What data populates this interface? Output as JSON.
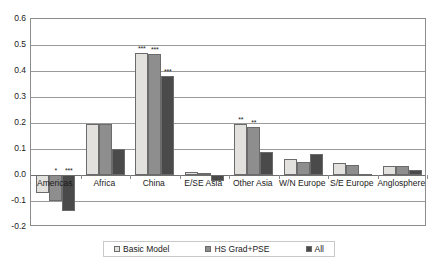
{
  "chart_data": {
    "type": "bar",
    "title": "",
    "subtitle": "",
    "xlabel": "",
    "ylabel": "",
    "ylim": [
      -0.2,
      0.6
    ],
    "ytick_labels": [
      "0.6",
      "0.5",
      "0.4",
      "0.3",
      "0.2",
      "0.1",
      "0.0",
      "-0.1",
      "-0.2"
    ],
    "ytick_values": [
      0.6,
      0.5,
      0.4,
      0.3,
      0.2,
      0.1,
      0.0,
      -0.1,
      -0.2
    ],
    "grid": true,
    "grid_axis": "y",
    "legend_position": "bottom",
    "categories": [
      "Americas",
      "Africa",
      "China",
      "E/SE Asia",
      "Other Asia",
      "W/N Europe",
      "S/E Europe",
      "Anglosphere"
    ],
    "series": [
      {
        "name": "Basic Model",
        "color": "#e2e1dd",
        "values": [
          -0.07,
          0.195,
          0.47,
          0.012,
          0.195,
          0.06,
          0.045,
          0.035
        ],
        "significance": [
          "",
          "",
          "***",
          "",
          "**",
          "",
          "",
          ""
        ]
      },
      {
        "name": "HS Grad+PSE",
        "color": "#8e8e8e",
        "values": [
          -0.1,
          0.195,
          0.465,
          0.006,
          0.185,
          0.05,
          0.04,
          0.035
        ],
        "significance": [
          "*",
          "",
          "***",
          "",
          "**",
          "",
          "",
          ""
        ]
      },
      {
        "name": "All",
        "color": "#4a4a4a",
        "values": [
          -0.14,
          0.1,
          0.38,
          -0.022,
          0.09,
          0.08,
          0.005,
          0.02
        ],
        "significance": [
          "***",
          "",
          "***",
          "",
          "",
          "",
          "",
          ""
        ]
      }
    ]
  },
  "legend": {
    "items": [
      {
        "label": "Basic Model",
        "swatch_class": "s1",
        "icon": "legend-swatch-light"
      },
      {
        "label": "HS Grad+PSE",
        "swatch_class": "s2",
        "icon": "legend-swatch-medium"
      },
      {
        "label": "All",
        "swatch_class": "s3",
        "icon": "legend-swatch-dark"
      }
    ]
  },
  "colors": {
    "series_1": "#e2e1dd",
    "series_2": "#8e8e8e",
    "series_3": "#4a4a4a",
    "grid": "#9a9a9a",
    "frame": "#8c8c8c",
    "text": "#1a1a1a",
    "background": "#ffffff"
  }
}
